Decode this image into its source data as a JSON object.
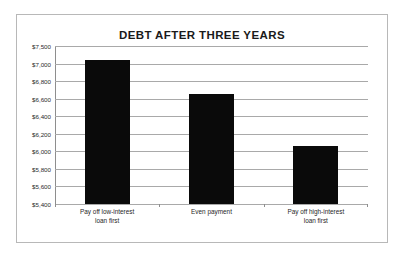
{
  "chart_data": {
    "type": "bar",
    "title": "DEBT AFTER THREE YEARS",
    "xlabel": "",
    "ylabel": "",
    "categories": [
      "Pay off low-interest loan first",
      "Even payment",
      "Pay off high-interest loan first"
    ],
    "category_lines": [
      [
        "Pay off low-interest",
        "loan first"
      ],
      [
        "Even payment",
        ""
      ],
      [
        "Pay off high-interest",
        "loan first"
      ]
    ],
    "values": [
      7100,
      6650,
      6060
    ],
    "ylim": [
      5400,
      7500
    ],
    "ytick_labels": [
      "$7,500",
      "$7,000",
      "$6,800",
      "$6,600",
      "$6,400",
      "$6,200",
      "$6,000",
      "$5,800",
      "$5,600",
      "$5,400"
    ],
    "ytick_values": [
      7500,
      7000,
      6800,
      6600,
      6400,
      6200,
      6000,
      5800,
      5600,
      5400
    ],
    "grid": true,
    "legend": "none",
    "bar_color": "#0a0a0a",
    "gridline_color": "#a9a9a9",
    "axis_color": "#8e8e8e",
    "frame_color": "#b8b8b8",
    "title_color": "#1a1a1a"
  }
}
